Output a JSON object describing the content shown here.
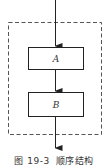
{
  "diagram": {
    "type": "flowchart",
    "structure": "sequential",
    "container": {
      "style": "dashed",
      "color": "#555555"
    },
    "nodes": [
      {
        "id": "A",
        "label": "A"
      },
      {
        "id": "B",
        "label": "B"
      }
    ],
    "edges": [
      {
        "from": "entry",
        "to": "A"
      },
      {
        "from": "A",
        "to": "B"
      },
      {
        "from": "B",
        "to": "exit"
      }
    ],
    "line_color": "#222222"
  },
  "caption": {
    "figure_number": "图 19-3",
    "title": "顺序结构"
  }
}
